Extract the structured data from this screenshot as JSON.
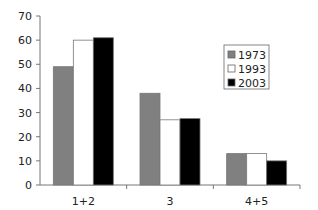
{
  "chart_data": {
    "type": "bar",
    "title": "",
    "xlabel": "",
    "ylabel": "",
    "categories": [
      "1+2",
      "3",
      "4+5"
    ],
    "series": [
      {
        "name": "1973",
        "color": "#808080",
        "values": [
          49,
          38,
          13
        ]
      },
      {
        "name": "1993",
        "color": "#ffffff",
        "values": [
          60,
          27,
          13
        ]
      },
      {
        "name": "2003",
        "color": "#000000",
        "values": [
          61,
          27.5,
          10
        ]
      }
    ],
    "ylim": [
      0,
      70
    ],
    "yticks": [
      0,
      10,
      20,
      30,
      40,
      50,
      60,
      70
    ],
    "grid": false,
    "legend_position": "right-inside"
  }
}
